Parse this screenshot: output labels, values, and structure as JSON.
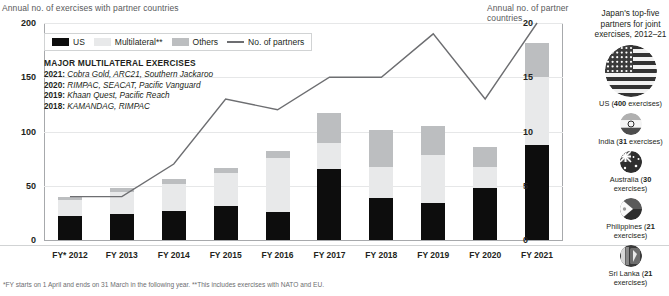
{
  "axes": {
    "left_title": "Annual no. of exercises with partner countries",
    "right_title": "Annual no. of partner countries",
    "left_ticks": [
      "200",
      "150",
      "100",
      "50",
      "0"
    ],
    "right_ticks": [
      "20",
      "15",
      "10",
      "5",
      "0"
    ]
  },
  "legend": {
    "us": "US",
    "multilateral": "Multilateral**",
    "others": "Others",
    "partners": "No. of partners"
  },
  "annotation": {
    "title": "MAJOR MULTILATERAL EXERCISES",
    "rows": [
      {
        "year": "2021",
        "text": "Cobra Gold, ARC21, Southern Jackaroo"
      },
      {
        "year": "2020",
        "text": "RIMPAC, SEACAT, Pacific Vanguard"
      },
      {
        "year": "2019",
        "text": "Khaan Quest, Pacific Reach"
      },
      {
        "year": "2018",
        "text": "KAMANDAG, RIMPAC"
      }
    ]
  },
  "footnote": "*FY starts on 1 April and ends on 31 March in the following year. **This includes exercises with NATO and EU.",
  "sidebar": {
    "title": "Japan's top-five partners for joint exercises, 2012–21",
    "entries": [
      {
        "name": "US",
        "count": "400",
        "caption_suffix": " exercises)",
        "icon": "us-flag-icon"
      },
      {
        "name": "India",
        "count": "31",
        "caption_suffix": " exercises)",
        "icon": "india-flag-icon"
      },
      {
        "name": "Australia",
        "count": "30",
        "caption_suffix": " exercises)",
        "icon": "australia-flag-icon"
      },
      {
        "name": "Philippines",
        "count": "21",
        "caption_suffix": " exercises)",
        "icon": "philippines-flag-icon"
      },
      {
        "name": "Sri Lanka",
        "count": "21",
        "caption_suffix": " exercises)",
        "icon": "srilanka-flag-icon"
      }
    ]
  },
  "colors": {
    "us": "#0d0d0d",
    "multilateral": "#e8e9ea",
    "others": "#bcbec0",
    "line": "#6d6e71",
    "grid": "#e6e7e8"
  },
  "chart_data": {
    "type": "bar",
    "title": "Annual no. of exercises with partner countries",
    "xlabel": "",
    "ylabel": "Annual no. of exercises with partner countries",
    "ylim": [
      0,
      200
    ],
    "y2label": "Annual no. of partner countries",
    "y2lim": [
      0,
      20
    ],
    "grid": true,
    "legend_position": "top-left",
    "categories": [
      "FY* 2012",
      "FY 2013",
      "FY 2014",
      "FY 2015",
      "FY 2016",
      "FY 2017",
      "FY 2018",
      "FY 2019",
      "FY 2020",
      "FY 2021"
    ],
    "series": [
      {
        "name": "US",
        "type": "bar",
        "stack": "exercises",
        "values": [
          22,
          24,
          27,
          31,
          26,
          65,
          39,
          34,
          48,
          88
        ]
      },
      {
        "name": "Multilateral**",
        "type": "bar",
        "stack": "exercises",
        "values": [
          15,
          20,
          25,
          31,
          50,
          24,
          28,
          44,
          19,
          62
        ]
      },
      {
        "name": "Others",
        "type": "bar",
        "stack": "exercises",
        "values": [
          3,
          4,
          4,
          4,
          6,
          28,
          34,
          27,
          19,
          32
        ]
      },
      {
        "name": "No. of partners",
        "type": "line",
        "axis": "y2",
        "values": [
          4,
          4,
          7,
          13,
          12,
          15,
          15,
          19,
          13,
          20
        ]
      }
    ],
    "totals": [
      40,
      48,
      56,
      66,
      82,
      117,
      101,
      105,
      86,
      182
    ]
  }
}
